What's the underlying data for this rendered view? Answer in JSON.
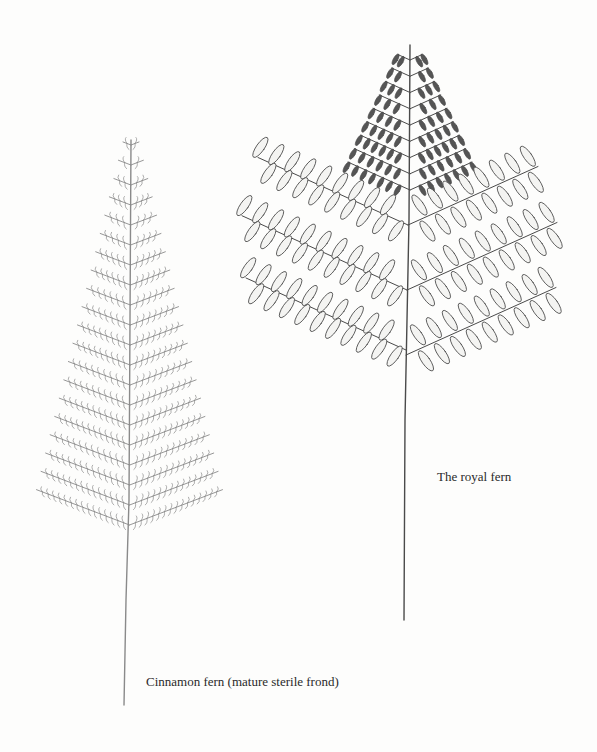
{
  "plate": {
    "background": "#fdfdfc",
    "ink": "#3a3a3a",
    "figures": [
      {
        "id": "cinnamon",
        "caption": "Cinnamon fern (mature sterile frond)",
        "ink": "#8a8a8a"
      },
      {
        "id": "royal",
        "caption": "The royal fern",
        "ink": "#4a4a4a"
      }
    ]
  }
}
